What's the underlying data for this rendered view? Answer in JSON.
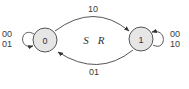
{
  "diagram": {
    "type": "state-machine",
    "colors": {
      "node_fill": "#e6e6e6",
      "node_stroke": "#555555",
      "edge": "#444444",
      "text": "#333333"
    },
    "states": [
      {
        "id": "s0",
        "label": "0"
      },
      {
        "id": "s1",
        "label": "1"
      }
    ],
    "inputs_label": {
      "s": "S",
      "r": "R"
    },
    "transitions": [
      {
        "from": "0",
        "to": "1",
        "label": "10"
      },
      {
        "from": "1",
        "to": "0",
        "label": "01"
      },
      {
        "from": "0",
        "to": "0",
        "label_line1": "00",
        "label_line2": "01"
      },
      {
        "from": "1",
        "to": "1",
        "label_line1": "00",
        "label_line2": "10"
      }
    ]
  }
}
